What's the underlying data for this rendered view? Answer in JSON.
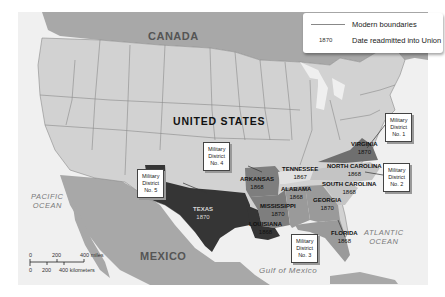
{
  "map": {
    "title": "Readmission of Confederate States into the Union",
    "countries": {
      "canada": "CANADA",
      "mexico": "MEXICO",
      "united_states": "UNITED STATES"
    },
    "water": {
      "pacific": [
        "PACIFIC",
        "OCEAN"
      ],
      "atlantic": [
        "ATLANTIC",
        "OCEAN"
      ],
      "gulf": "Gulf of Mexico"
    },
    "states": [
      {
        "name": "VIRGINIA",
        "year": "1870"
      },
      {
        "name": "NORTH CAROLINA",
        "year": "1868"
      },
      {
        "name": "SOUTH CAROLINA",
        "year": "1868"
      },
      {
        "name": "TENNESSEE",
        "year": "1867"
      },
      {
        "name": "GEORGIA",
        "year": "1870"
      },
      {
        "name": "ALABAMA",
        "year": "1868"
      },
      {
        "name": "FLORIDA",
        "year": "1868"
      },
      {
        "name": "MISSISSIPPI",
        "year": "1870"
      },
      {
        "name": "LOUISIANA",
        "year": "1868"
      },
      {
        "name": "ARKANSAS",
        "year": "1868"
      },
      {
        "name": "TEXAS",
        "year": "1870"
      }
    ],
    "districts": [
      {
        "line1": "Military",
        "line2": "District",
        "line3": "No. 1"
      },
      {
        "line1": "Military",
        "line2": "District",
        "line3": "No. 2"
      },
      {
        "line1": "Military",
        "line2": "District",
        "line3": "No. 3"
      },
      {
        "line1": "Military",
        "line2": "District",
        "line3": "No. 4"
      },
      {
        "line1": "Military",
        "line2": "District",
        "line3": "No. 5"
      }
    ],
    "legend": {
      "boundaries": "Modern boundaries",
      "date_sample": "1870",
      "date_label": "Date readmitted into Union"
    },
    "scale": {
      "miles": [
        "0",
        "200",
        "400 miles"
      ],
      "kilometers": [
        "0",
        "200",
        "400 kilometers"
      ]
    },
    "colors": {
      "water": "#f2f2f2",
      "foreign_land": "#a9a9a9",
      "us_land": "#d2d2d2",
      "district1": "#6f6f6f",
      "district2": "#c4c4c4",
      "district3": "#9a9a9a",
      "district4": "#7e7e7e",
      "district5": "#353535"
    }
  }
}
